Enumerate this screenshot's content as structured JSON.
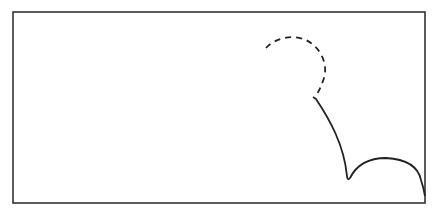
{
  "diagram": {
    "type": "trajectory-path",
    "canvas": {
      "width": 437,
      "height": 216,
      "background": "#ffffff"
    },
    "frame": {
      "x": 13,
      "y": 12,
      "width": 412,
      "height": 191,
      "stroke": "#333333",
      "stroke_width": 1.6
    },
    "paths": [
      {
        "name": "dashed-arc",
        "style": "dashed",
        "stroke": "#222222",
        "d": "M 266 48 C 275 38, 292 34, 306 40 C 322 48, 328 66, 324 78 C 322 84, 320 89, 317 94"
      },
      {
        "name": "solid-descent-curve",
        "style": "solid",
        "stroke": "#222222",
        "d": "M 313 97 L 316 99 C 330 120, 344 145, 347 176 C 347 179, 348 180, 350 178"
      },
      {
        "name": "solid-arch-curve",
        "style": "solid",
        "stroke": "#222222",
        "d": "M 350 178 C 358 162, 372 158, 386 158 C 405 159, 418 166, 421 180 C 423 186, 424 190, 425 196"
      }
    ],
    "labels": []
  }
}
